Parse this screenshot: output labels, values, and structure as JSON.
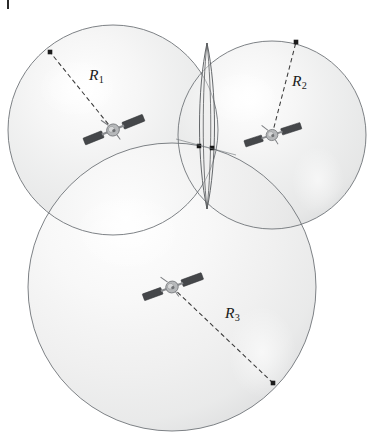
{
  "figure": {
    "background_color": "#ffffff",
    "corner_tick": {
      "name": "corner-tick-mark",
      "color": "#2a2a2a",
      "x": 7,
      "y": 0,
      "width": 2,
      "height": 9
    },
    "style": {
      "sphere_outline_color": "#6f7478",
      "sphere_fill_light": "#fbfbfb",
      "sphere_fill_mid": "#e9e9e9",
      "sphere_fill_dark": "#d2d3d4",
      "dashed_line_color": "#3a3a3a",
      "endpoint_dot_color": "#1b1b1b",
      "satellite_body_color": "#a9aaac",
      "satellite_panel_color": "#494b4e",
      "label_color": "#1b1b1b"
    },
    "spheres": [
      {
        "id": "sphere-1",
        "name": "range-sphere-1",
        "cx": 113,
        "cy": 130,
        "r": 105,
        "radius_label": "R",
        "radius_subscript": "1",
        "label_x": 89,
        "label_y": 66,
        "radius_line": {
          "x1": 113,
          "y1": 130,
          "x2": 50,
          "y2": 52
        },
        "endpoint_dot": {
          "x": 50,
          "y": 52
        }
      },
      {
        "id": "sphere-2",
        "name": "range-sphere-2",
        "cx": 272,
        "cy": 135,
        "r": 94,
        "radius_label": "R",
        "radius_subscript": "2",
        "label_x": 292,
        "label_y": 72,
        "radius_line": {
          "x1": 272,
          "y1": 135,
          "x2": 296,
          "y2": 42
        },
        "endpoint_dot": {
          "x": 296,
          "y": 42
        }
      },
      {
        "id": "sphere-3",
        "name": "range-sphere-3",
        "cx": 172,
        "cy": 287,
        "r": 144,
        "radius_label": "R",
        "radius_subscript": "3",
        "label_x": 225,
        "label_y": 304,
        "radius_line": {
          "x1": 172,
          "y1": 287,
          "x2": 273,
          "y2": 383
        },
        "endpoint_dot": {
          "x": 273,
          "y": 383
        }
      }
    ],
    "intersection_lens": {
      "name": "sphere-intersection-lens",
      "top_x": 207,
      "top_y": 43,
      "bottom_x": 207,
      "bottom_y": 209,
      "half_width_outer": 10,
      "half_width_inner": 5,
      "outline_color": "#55585b"
    },
    "intersection_points": [
      {
        "name": "intersection-point-left",
        "x": 199,
        "y": 146,
        "size": 4.5
      },
      {
        "name": "intersection-point-right",
        "x": 212,
        "y": 148,
        "size": 4.5
      }
    ],
    "satellites": [
      {
        "id": "satellite-1",
        "name": "satellite-icon-1",
        "cx": 113,
        "cy": 130,
        "rotation": -22,
        "scale": 1.0
      },
      {
        "id": "satellite-2",
        "name": "satellite-icon-2",
        "cx": 272,
        "cy": 135,
        "rotation": -18,
        "scale": 0.92
      },
      {
        "id": "satellite-3",
        "name": "satellite-icon-3",
        "cx": 172,
        "cy": 287,
        "rotation": -20,
        "scale": 0.98
      }
    ]
  }
}
